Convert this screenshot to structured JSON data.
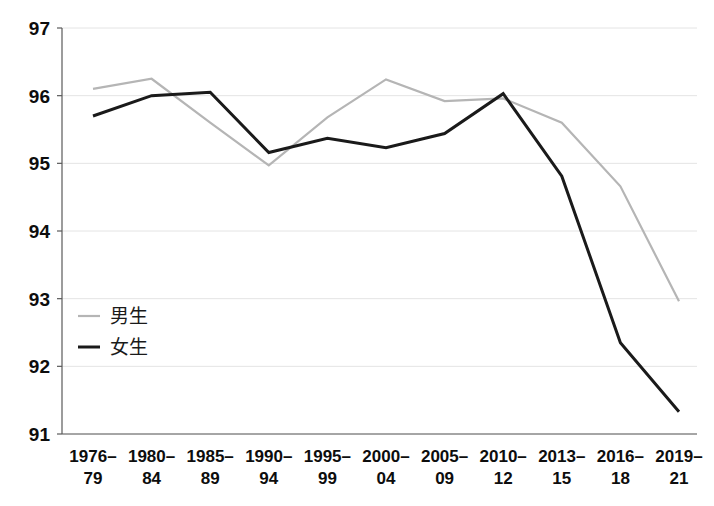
{
  "chart_data": {
    "type": "line",
    "title": "",
    "subtitle": "",
    "xlabel": "",
    "ylabel": "",
    "grid": true,
    "legend_position": "inside-left",
    "categories": [
      "1976–\n79",
      "1980–\n84",
      "1985–\n89",
      "1990–\n94",
      "1995–\n99",
      "2000–\n04",
      "2005–\n09",
      "2010–\n12",
      "2013–\n15",
      "2016–\n18",
      "2019–\n21"
    ],
    "categories_line1": [
      "1976–",
      "1980–",
      "1985–",
      "1990–",
      "1995–",
      "2000–",
      "2005–",
      "2010–",
      "2013–",
      "2016–",
      "2019–"
    ],
    "categories_line2": [
      "79",
      "84",
      "89",
      "94",
      "99",
      "04",
      "09",
      "12",
      "15",
      "18",
      "21"
    ],
    "ylim": [
      91,
      97
    ],
    "yticks": [
      91,
      92,
      93,
      94,
      95,
      96,
      97
    ],
    "ytick_labels": [
      "91",
      "92",
      "93",
      "94",
      "95",
      "96",
      "97"
    ],
    "series": [
      {
        "name": "男生",
        "color": "#b5b5b5",
        "values": [
          96.1,
          96.25,
          95.6,
          94.97,
          95.68,
          96.24,
          95.92,
          95.96,
          95.6,
          94.66,
          92.96
        ]
      },
      {
        "name": "女生",
        "color": "#1a1a1a",
        "values": [
          95.7,
          96.0,
          96.05,
          95.16,
          95.37,
          95.23,
          95.44,
          96.03,
          94.81,
          92.35,
          91.33
        ]
      }
    ]
  },
  "legend": {
    "items": [
      {
        "label": "男生",
        "color": "#b5b5b5"
      },
      {
        "label": "女生",
        "color": "#1a1a1a"
      }
    ]
  },
  "colors": {
    "axis": "#5a5a5a",
    "grid": "#e4e4e4",
    "boys_line": "#b5b5b5",
    "girls_line": "#1a1a1a",
    "text": "#0d0d0d",
    "background": "#ffffff"
  }
}
